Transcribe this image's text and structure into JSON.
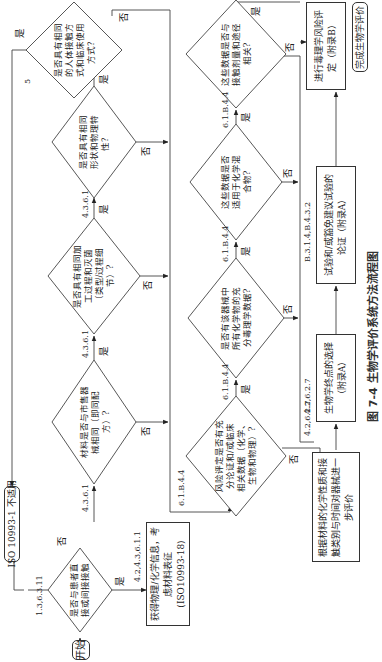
{
  "figure": {
    "caption": "图 7-4  生物学评价系统方法流程图"
  },
  "nodes": {
    "start": "开始",
    "q_contact": "是否与患者直接或间接接触",
    "iso_na": "ISO 10993-1 不适用",
    "get_info": "获得物理/化学信息，考虑材料表征(ISO10993-18)",
    "q_material": "材料是否与市售器械相同（即同配方）?",
    "q_process": "是否具有相同加工过程和灭菌（类型/过程细节）?",
    "q_geometry": "是否具有相同形状和物理特性？",
    "q_contact_type": "是否具有相同的人体接触方式和临床使用方式？",
    "q_risk": "风险评定是否有充分论证和/或临床相关数据（化学、生物和物理）?",
    "q_tox": "是否有该器械中所有化学物的充分毒理学数据?",
    "q_mixture": "这些数据是否适用于化学混合物?",
    "q_route": "这些数据是否与接触剂量和途径相关?",
    "r_further": "根据材料的化学性质和接触类别与时间对器械进一步评价",
    "r_endpoints": "生物学终点的选择（附录A）",
    "r_tests": "试验和/或豁免建议试验的论证（附录A）",
    "r_tox_risk": "进行毒理学风险评定（附录B）",
    "end": "完成生物学评价"
  },
  "labels": {
    "yes": "是",
    "no": "否",
    "ref_contact": "1.3,6.3.11",
    "ref_get_info": "4.2,4.3,6.1.1",
    "ref_material": "4.3.6.1",
    "ref_process": "4.3.6.1",
    "ref_geometry": "4.3.6.1",
    "ref_contact_type": "5",
    "ref_risk": "6.1.B.4.4",
    "ref_tox": "6.1.B.4.4",
    "ref_mixture": "6.1.B.4.4",
    "ref_route": "6.1.B.4.4",
    "ref_further": "4.2,6.2.7",
    "ref_endpoints": "4.2,6.2.7",
    "ref_tests": "B.3.1.4,B.4.3.2"
  }
}
